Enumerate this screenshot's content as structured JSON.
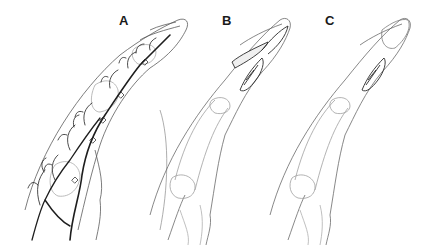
{
  "figure": {
    "panels": [
      {
        "label": "A",
        "subject": "finger-vascular-anatomy",
        "label_pos": [
          119,
          14
        ]
      },
      {
        "label": "B",
        "subject": "finger-incision-flap-raised",
        "label_pos": [
          222,
          14
        ]
      },
      {
        "label": "C",
        "subject": "finger-incision-flap-closed",
        "label_pos": [
          325,
          14
        ]
      }
    ],
    "colors": {
      "background": "#ffffff",
      "vessel": "#1e1e1e",
      "outline": "#6a6a6a",
      "bone": "#9a9a9a",
      "label": "#1a1a1a"
    }
  }
}
